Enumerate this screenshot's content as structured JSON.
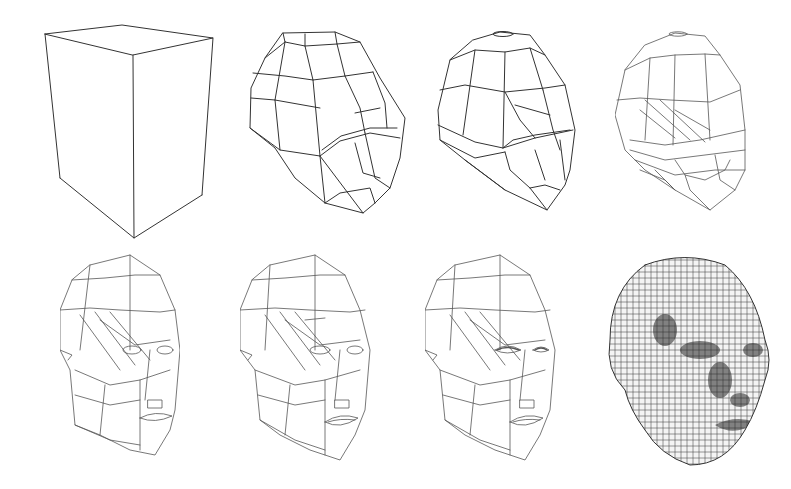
{
  "figure": {
    "background": "#ffffff",
    "line_color": "#333333",
    "layout": {
      "rows": 2,
      "cols": 4
    },
    "panels": [
      {
        "step": 1,
        "row": 0,
        "col": 0,
        "subject": "box-primitive",
        "x": 40,
        "y": 20,
        "w": 180,
        "h": 220
      },
      {
        "step": 2,
        "row": 0,
        "col": 1,
        "subject": "coarse-head-mesh",
        "x": 245,
        "y": 28,
        "w": 160,
        "h": 200
      },
      {
        "step": 3,
        "row": 0,
        "col": 2,
        "subject": "refined-head-mesh",
        "x": 435,
        "y": 30,
        "w": 160,
        "h": 190
      },
      {
        "step": 4,
        "row": 0,
        "col": 3,
        "subject": "head-mesh-with-face-loops",
        "x": 615,
        "y": 30,
        "w": 160,
        "h": 190
      },
      {
        "step": 5,
        "row": 1,
        "col": 0,
        "subject": "head-mesh-with-eyes-nose-mouth",
        "x": 60,
        "y": 250,
        "w": 120,
        "h": 210
      },
      {
        "step": 6,
        "row": 1,
        "col": 1,
        "subject": "head-mesh-detailed-mouth",
        "x": 240,
        "y": 250,
        "w": 135,
        "h": 210
      },
      {
        "step": 7,
        "row": 1,
        "col": 2,
        "subject": "head-mesh-detailed-eyes",
        "x": 425,
        "y": 250,
        "w": 135,
        "h": 210
      },
      {
        "step": 8,
        "row": 1,
        "col": 3,
        "subject": "subdivided-dense-head-mesh",
        "x": 605,
        "y": 250,
        "w": 165,
        "h": 220
      }
    ]
  }
}
